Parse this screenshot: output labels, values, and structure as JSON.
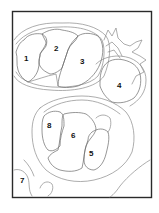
{
  "figure": {
    "type": "line-drawing diagram with numbered regions",
    "colors": {
      "frame": "#2a2a2a",
      "lines": "#8a8a8a",
      "labels": "#111111",
      "background": "#ffffff"
    },
    "labels": [
      {
        "id": "1",
        "text": "1"
      },
      {
        "id": "2",
        "text": "2"
      },
      {
        "id": "3",
        "text": "3"
      },
      {
        "id": "4",
        "text": "4"
      },
      {
        "id": "5",
        "text": "5"
      },
      {
        "id": "6",
        "text": "6"
      },
      {
        "id": "7",
        "text": "7"
      },
      {
        "id": "8",
        "text": "8"
      }
    ]
  }
}
